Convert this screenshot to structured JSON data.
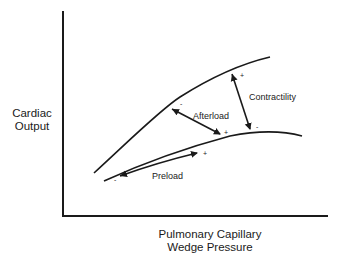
{
  "diagram": {
    "title": "",
    "y_axis_label_line1": "Cardiac",
    "y_axis_label_line2": "Output",
    "x_axis_label_line1": "Pulmonary Capillary",
    "x_axis_label_line2": "Wedge Pressure",
    "curves": [
      {
        "name": "upper-curve",
        "description": "Higher Frank-Starling curve"
      },
      {
        "name": "lower-curve",
        "description": "Lower Frank-Starling curve"
      }
    ],
    "annotations": {
      "afterload": {
        "label": "Afterload",
        "minus_sign": "-",
        "plus_sign": "+"
      },
      "contractility": {
        "label": "Contractility",
        "plus_sign": "+",
        "minus_sign": "-"
      },
      "preload": {
        "label": "Preload",
        "minus_sign": "-",
        "plus_sign": "+"
      }
    },
    "colors": {
      "line": "#1a1a1a",
      "background": "#ffffff"
    }
  }
}
